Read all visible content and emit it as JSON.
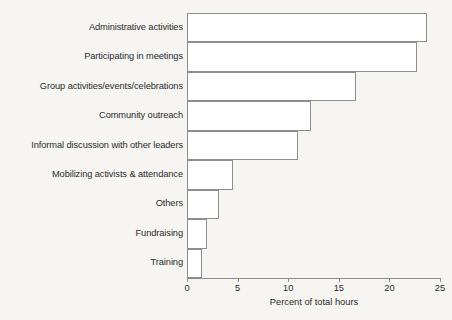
{
  "chart_data": {
    "type": "bar",
    "orientation": "horizontal",
    "title": "",
    "xlabel": "Percent of total hours",
    "ylabel": "",
    "xlim": [
      0,
      25
    ],
    "xticks": [
      0,
      5,
      10,
      15,
      20,
      25
    ],
    "xtick_labels": [
      "0",
      "5",
      "10",
      "15",
      "20",
      "25"
    ],
    "grid": false,
    "legend": false,
    "bar_style": {
      "fill": "#ffffff",
      "edge": "#8e8e8e"
    },
    "categories": [
      "Administrative activities",
      "Participating in meetings",
      "Group activities/events/celebrations",
      "Community outreach",
      "Informal discussion with other leaders",
      "Mobilizing activists & attendance",
      "Others",
      "Fundraising",
      "Training"
    ],
    "values": [
      23.7,
      22.7,
      16.7,
      12.3,
      11.0,
      4.5,
      3.2,
      2.0,
      1.5
    ]
  },
  "colors": {
    "background": "#f6f5f2",
    "axis": "#8c8c8c",
    "text": "#2b2b2b",
    "bar_edge": "#8e8e8e",
    "bar_fill": "#ffffff"
  }
}
